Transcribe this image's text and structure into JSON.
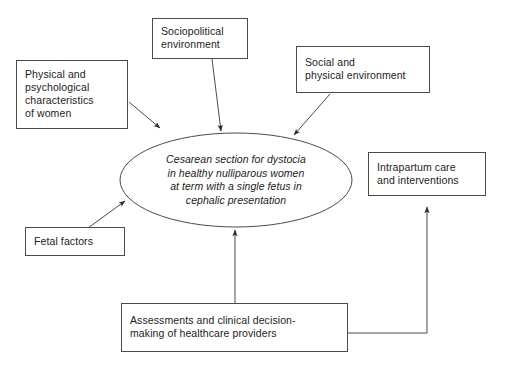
{
  "diagram": {
    "type": "conceptual-framework-flow-diagram",
    "background_color": "#ffffff",
    "line_color": "#4a4a4a",
    "text_color": "#1c1c1c",
    "center_node": {
      "id": "center-outcome",
      "shape": "ellipse",
      "style": "italic",
      "lines": [
        "Cesarean section for dystocia",
        "in healthy nulliparous women",
        "at term with a single fetus in",
        "cephalic presentation"
      ]
    },
    "boxes": [
      {
        "id": "physical-psychological-characteristics",
        "lines": [
          "Physical and",
          "psychological",
          "characteristics",
          "of women"
        ]
      },
      {
        "id": "sociopolitical-environment",
        "lines": [
          "Sociopolitical",
          "environment"
        ]
      },
      {
        "id": "social-physical-environment",
        "lines": [
          "Social and",
          "physical environment"
        ]
      },
      {
        "id": "intrapartum-care",
        "lines": [
          "Intrapartum care",
          "and interventions"
        ]
      },
      {
        "id": "fetal-factors",
        "lines": [
          "Fetal factors"
        ]
      },
      {
        "id": "assessments-decision-making",
        "lines": [
          "Assessments and clinical decision-",
          "making of healthcare providers"
        ]
      }
    ],
    "arrows": [
      {
        "id": "arrow-physical-to-center",
        "from": "physical-psychological-characteristics",
        "to": "center-outcome"
      },
      {
        "id": "arrow-sociopolitical-to-center",
        "from": "sociopolitical-environment",
        "to": "center-outcome"
      },
      {
        "id": "arrow-social-to-center",
        "from": "social-physical-environment",
        "to": "center-outcome"
      },
      {
        "id": "arrow-fetal-to-center",
        "from": "fetal-factors",
        "to": "center-outcome"
      },
      {
        "id": "arrow-assessments-to-center",
        "from": "assessments-decision-making",
        "to": "center-outcome"
      },
      {
        "id": "arrow-assessments-to-intrapartum",
        "from": "assessments-decision-making",
        "to": "intrapartum-care"
      }
    ]
  }
}
